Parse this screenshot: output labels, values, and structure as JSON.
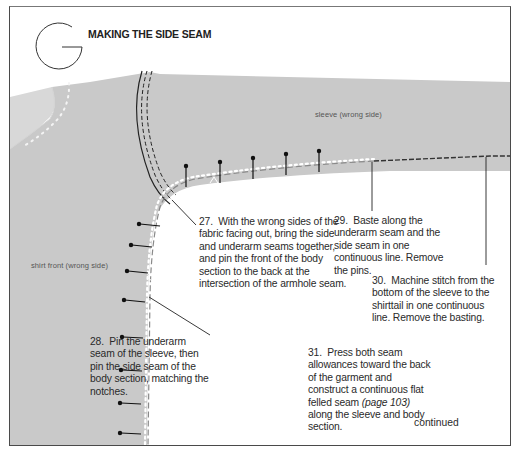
{
  "section": {
    "letter_icon": "letter-G-circle",
    "title": "MAKING THE SIDE SEAM"
  },
  "illustration": {
    "labels": {
      "sleeve": "sleeve (wrong side)",
      "shirt_front": "shirt front (wrong side)"
    },
    "colors": {
      "fabric": "#c8c8c8",
      "fabric_light": "#d6d6d6",
      "stitch": "#222222",
      "basting": "#ffffff"
    }
  },
  "steps": [
    {
      "number": "27.",
      "text": "With the wrong sides of the fabric facing out, bring the side and underarm seams together, and pin the front of the body section to the back at the intersection of the armhole seam."
    },
    {
      "number": "28.",
      "text": "Pin the underarm seam of the sleeve, then pin the side seam of the body section, matching the notches."
    },
    {
      "number": "29.",
      "text": "Baste along the underarm seam and the side seam in one continuous line. Remove the pins."
    },
    {
      "number": "30.",
      "text": "Machine stitch from the bottom of the sleeve to the shirttail in one continuous line. Remove the basting."
    },
    {
      "number": "31.",
      "text_before": "Press both seam allowances toward the back of the garment and construct a continuous flat felled seam ",
      "ref": "(page 103)",
      "text_after": " along the sleeve and body section."
    }
  ],
  "footer": {
    "continued": "continued"
  }
}
